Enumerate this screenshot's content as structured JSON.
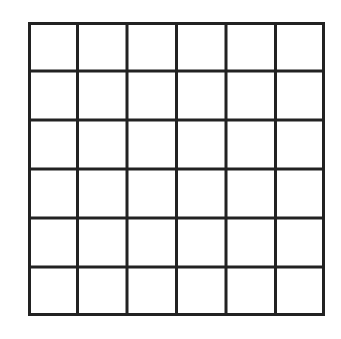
{
  "diagram": {
    "type": "grid",
    "rows": 6,
    "columns": 6,
    "line_color": "#222222",
    "background": "#ffffff",
    "cells_filled": []
  }
}
